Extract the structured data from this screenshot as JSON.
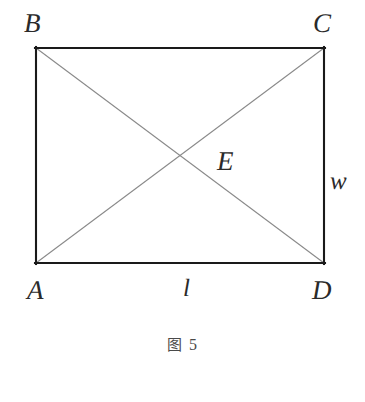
{
  "figure": {
    "caption_prefix": "图",
    "caption_number": "5",
    "caption_full": "图 5",
    "background_color": "#ffffff"
  },
  "diagram": {
    "type": "geometry-rectangle-with-diagonals",
    "shape": "rectangle",
    "stroke_color_outline": "#1a1a1a",
    "stroke_color_diagonal": "#8a8a8a",
    "outline_width_px": 2,
    "diagonal_width_px": 1,
    "rect": {
      "left": 35,
      "top": 47,
      "right": 325,
      "bottom": 264,
      "width": 290,
      "height": 217
    },
    "vertices": [
      {
        "id": "B",
        "label": "B",
        "x": 35,
        "y": 47
      },
      {
        "id": "C",
        "label": "C",
        "x": 325,
        "y": 47
      },
      {
        "id": "A",
        "label": "A",
        "x": 35,
        "y": 264
      },
      {
        "id": "D",
        "label": "D",
        "x": 325,
        "y": 264
      }
    ],
    "intersection": {
      "id": "E",
      "label": "E",
      "x": 180,
      "y": 155.5
    },
    "diagonals": [
      {
        "from": "B",
        "to": "D"
      },
      {
        "from": "A",
        "to": "C"
      }
    ],
    "side_labels": [
      {
        "id": "l",
        "label": "l",
        "side": "AD",
        "meaning": "length"
      },
      {
        "id": "w",
        "label": "w",
        "side": "CD",
        "meaning": "width"
      }
    ]
  },
  "labels": {
    "B": "B",
    "C": "C",
    "E": "E",
    "w": "w",
    "A": "A",
    "l": "l",
    "D": "D"
  }
}
